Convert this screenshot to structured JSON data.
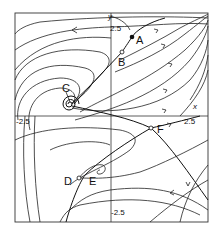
{
  "diagram": {
    "type": "phase-portrait",
    "axes": {
      "x_label": "x",
      "y_label": "y",
      "x_min_label": "-2.5",
      "x_max_label": "2.5",
      "y_min_label": "-2.5",
      "y_max_label": "2.5"
    },
    "points": [
      {
        "id": "A",
        "label": "A",
        "kind": "filled"
      },
      {
        "id": "B",
        "label": "B",
        "kind": "hollow"
      },
      {
        "id": "C",
        "label": "C",
        "kind": "spiral"
      },
      {
        "id": "D",
        "label": "D",
        "kind": "hollow"
      },
      {
        "id": "E",
        "label": "E",
        "kind": "spiral"
      },
      {
        "id": "F",
        "label": "F",
        "kind": "hollow"
      }
    ],
    "colors": {
      "stroke": "#222222",
      "background": "#ffffff"
    }
  }
}
